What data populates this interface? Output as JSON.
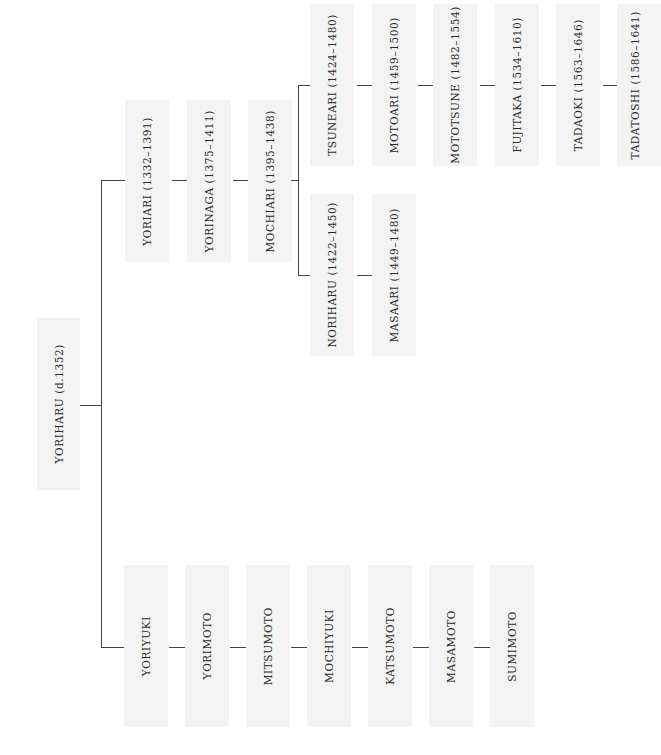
{
  "diagram": {
    "type": "genealogy-tree",
    "orientation": "rotated-90-ccw",
    "colors": {
      "node_fill": "#f3f3f3",
      "line": "#444444",
      "text": "#2b2b2b",
      "background": "#ffffff"
    },
    "root": {
      "id": "yoriharu",
      "label": "YORIHARU (d.1352)"
    },
    "upper_line": [
      {
        "id": "yoriari",
        "label": "YORIARI (1332–1391)"
      },
      {
        "id": "yorinaga",
        "label": "YORINAGA (1375–1411)"
      },
      {
        "id": "mochiari",
        "label": "MOCHIARI (1395–1438)"
      }
    ],
    "mochiari_branch_a": [
      {
        "id": "tsuneari",
        "label": "TSUNEARI (1424–1480)"
      },
      {
        "id": "motoari",
        "label": "MOTOARI (1459–1500)"
      },
      {
        "id": "mototsune",
        "label": "MOTOTSUNE (1482–1554)"
      },
      {
        "id": "fujitaka",
        "label": "FUJITAKA (1534–1610)"
      },
      {
        "id": "tadaoki",
        "label": "TADAOKI (1563–1646)"
      },
      {
        "id": "tadatoshi",
        "label": "TADATOSHI (1586–1641)"
      }
    ],
    "mochiari_branch_b": [
      {
        "id": "noriharu",
        "label": "NORIHARU (1422–1450)"
      },
      {
        "id": "masaari",
        "label": "MASAARI (1449–1480)"
      }
    ],
    "lower_line": [
      {
        "id": "yoriyuki",
        "label": "YORIYUKI"
      },
      {
        "id": "yorimoto",
        "label": "YORIMOTO"
      },
      {
        "id": "mitsumoto",
        "label": "MITSUMOTO"
      },
      {
        "id": "mochiyuki",
        "label": "MOCHIYUKI"
      },
      {
        "id": "katsumoto",
        "label": "KATSUMOTO"
      },
      {
        "id": "masamoto",
        "label": "MASAMOTO"
      },
      {
        "id": "sumimoto",
        "label": "SUMIMOTO"
      }
    ]
  }
}
